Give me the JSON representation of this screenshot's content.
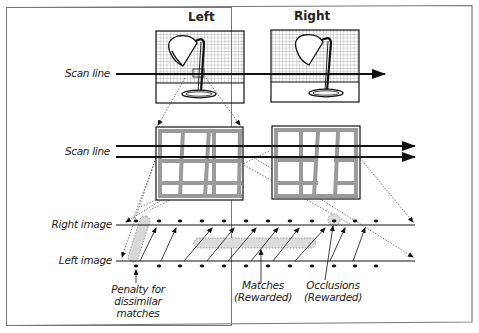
{
  "panels": {
    "left_title": "Left",
    "right_title": "Right"
  },
  "labels": {
    "scan_line_top": "Scan line",
    "scan_line_mid": "Scan line",
    "right_image": "Right image",
    "left_image": "Left image",
    "penalty": [
      "Penalty for",
      "dissimilar",
      "matches"
    ],
    "matches": [
      "Matches",
      "(Rewarded)"
    ],
    "occlusions": [
      "Occlusions",
      "(Rewarded)"
    ]
  },
  "colors": {
    "line": "#111111",
    "grid": "#888888",
    "highlight": "#d9d9d9",
    "window_frame": "#999999",
    "border": "#777777"
  },
  "scanline_model": {
    "right_image_pixels_x": [
      136,
      159,
      180,
      202,
      224,
      246,
      268,
      290,
      312,
      334,
      356,
      378
    ],
    "left_image_pixels_x": [
      136,
      159,
      180,
      202,
      224,
      246,
      268,
      290,
      312,
      334,
      356,
      378
    ],
    "matches": [
      [
        136,
        159
      ],
      [
        159,
        180
      ],
      [
        180,
        202
      ],
      [
        202,
        224
      ],
      [
        224,
        246
      ],
      [
        246,
        268
      ],
      [
        268,
        290
      ],
      [
        290,
        312
      ],
      [
        312,
        334
      ],
      [
        334,
        356
      ]
    ],
    "occlusion_pixel_right_x": 334,
    "penalty_pair": [
      136,
      159
    ]
  }
}
